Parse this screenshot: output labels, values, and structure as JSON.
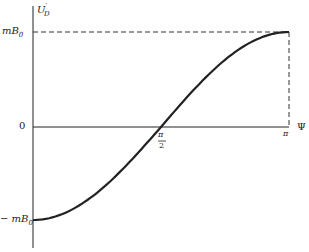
{
  "chart_data": {
    "type": "line",
    "title": "",
    "xlabel": "Ψ",
    "ylabel": "U'_D",
    "x_ticks": [
      {
        "value": 1.5708,
        "label": "π/2"
      },
      {
        "value": 3.1416,
        "label": "π"
      }
    ],
    "y_ticks": [
      {
        "value": 1,
        "label": "mB₀"
      },
      {
        "value": 0,
        "label": "0"
      },
      {
        "value": -1,
        "label": "− mB₀"
      }
    ],
    "xlim": [
      0,
      3.1416
    ],
    "ylim": [
      -1.3,
      1.2
    ],
    "grid": false,
    "series": [
      {
        "name": "U'_D = -mB₀ cos Ψ",
        "x": [
          0,
          0.3927,
          0.7854,
          1.1781,
          1.5708,
          1.9635,
          2.3562,
          2.7489,
          3.1416
        ],
        "values": [
          -1,
          -0.924,
          -0.707,
          -0.383,
          0,
          0.383,
          0.707,
          0.924,
          1
        ]
      }
    ],
    "annotations": [
      "dashed horizontal line at mB₀ from axis to Ψ=π",
      "dashed vertical line at Ψ=π from 0 to mB₀"
    ]
  },
  "labels": {
    "y_axis": "U",
    "y_axis_sub": "D",
    "y_axis_prime": "′",
    "x_axis": "Ψ",
    "y_top": "mB",
    "y_top_sub": "0",
    "y_zero": "0",
    "y_bottom": "− mB",
    "y_bottom_sub": "0",
    "x_pi_half_num": "π",
    "x_pi_half_den": "2",
    "x_pi": "π"
  }
}
